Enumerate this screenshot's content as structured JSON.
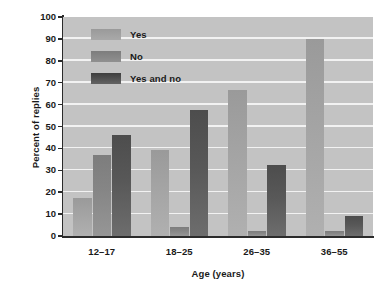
{
  "chart_data": {
    "type": "bar",
    "title": "",
    "xlabel": "Age (years)",
    "ylabel": "Percent of replies",
    "categories": [
      "12–17",
      "18–25",
      "26–35",
      "36–55"
    ],
    "series": [
      {
        "name": "Yes",
        "color": "#a3a3a3",
        "values": [
          17.5,
          39.5,
          66.5,
          90.0
        ]
      },
      {
        "name": "No",
        "color": "#868686",
        "values": [
          37.0,
          4.0,
          2.5,
          2.5
        ]
      },
      {
        "name": "Yes and no",
        "color": "#585858",
        "values": [
          46.0,
          57.5,
          32.5,
          9.0
        ]
      }
    ],
    "ylim": [
      0,
      100
    ],
    "yticks": [
      0,
      10,
      20,
      30,
      40,
      50,
      60,
      70,
      80,
      90,
      100
    ],
    "ytick_labels": [
      "0",
      "10",
      "20",
      "30",
      "40",
      "50",
      "60",
      "70",
      "80",
      "90",
      "100"
    ],
    "grid": true,
    "grid_axis": "y",
    "grid_color": "#f2f2f2",
    "plot_background": "#c3c3c3",
    "legend_position": "upper left inside",
    "legend_entries": [
      "Yes",
      "No",
      "Yes and no"
    ]
  }
}
